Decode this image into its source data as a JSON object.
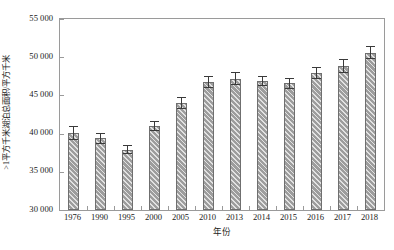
{
  "chart_data": {
    "type": "bar",
    "title": "",
    "subtitle": "",
    "xlabel": "年份",
    "ylabel": ">1平方千米湖泊总面积/平方千米",
    "categories": [
      "1976",
      "1990",
      "1995",
      "2000",
      "2005",
      "2010",
      "2013",
      "2014",
      "2015",
      "2016",
      "2017",
      "2018"
    ],
    "values": [
      40100,
      39400,
      37900,
      41000,
      44000,
      46800,
      47200,
      46900,
      46600,
      47900,
      48800,
      50600
    ],
    "errors": [
      900,
      700,
      600,
      700,
      800,
      800,
      800,
      700,
      700,
      800,
      900,
      900
    ],
    "ylim": [
      30000,
      55000
    ],
    "ytick_values": [
      30000,
      35000,
      40000,
      45000,
      50000,
      55000
    ],
    "ytick_labels": [
      "30 000",
      "35 000",
      "40 000",
      "45 000",
      "50 000",
      "55 000"
    ],
    "grid": false,
    "legend": null,
    "legend_position": "none",
    "bar_color": "#9d9d9d",
    "bar_edge_color": "#6f6f6f",
    "error_bar_color": "#3a3a3a",
    "axis_color": "#9a9a9a",
    "background_color": "#ffffff",
    "bar_hatch": "diagonal-stripes",
    "error_bar_style": "capped-vertical"
  }
}
